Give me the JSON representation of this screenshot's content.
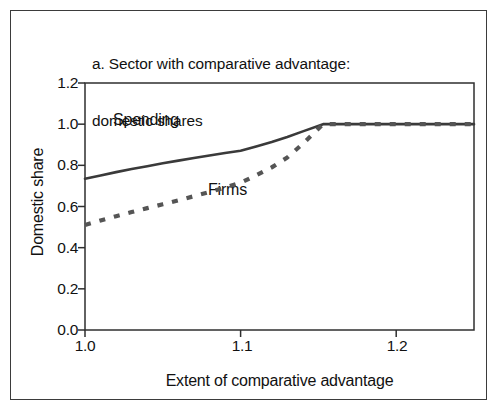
{
  "figure": {
    "title_line1": "a. Sector with comparative advantage:",
    "title_line2": "domestic shares",
    "frame_color": "#3b3b3b",
    "background_color": "#ffffff"
  },
  "chart_data": {
    "type": "line",
    "title": "a. Sector with comparative advantage: domestic shares",
    "xlabel": "Extent of comparative advantage",
    "ylabel": "Domestic share",
    "xlim": [
      1.0,
      1.25
    ],
    "ylim": [
      0.0,
      1.2
    ],
    "xticks": [
      1.0,
      1.1,
      1.2
    ],
    "xtick_labels": [
      "1.0",
      "1.1",
      "1.2"
    ],
    "yticks": [
      0.0,
      0.2,
      0.4,
      0.6,
      0.8,
      1.0,
      1.2
    ],
    "ytick_labels": [
      "0.0",
      "0.2",
      "0.4",
      "0.6",
      "0.8",
      "1.0",
      "1.2"
    ],
    "grid": false,
    "legend_position": "inline-annotations",
    "series": [
      {
        "name": "Spending",
        "style": "solid",
        "color": "#3a3a3a",
        "label_position": {
          "x": 1.018,
          "y": 1.035
        },
        "x": [
          1.0,
          1.01,
          1.02,
          1.03,
          1.04,
          1.05,
          1.06,
          1.07,
          1.08,
          1.09,
          1.1,
          1.11,
          1.12,
          1.13,
          1.14,
          1.153,
          1.17,
          1.19,
          1.21,
          1.23,
          1.25
        ],
        "y": [
          0.735,
          0.751,
          0.767,
          0.782,
          0.796,
          0.81,
          0.823,
          0.836,
          0.848,
          0.86,
          0.871,
          0.892,
          0.913,
          0.938,
          0.965,
          1.0,
          1.0,
          1.0,
          1.0,
          1.0,
          1.0
        ]
      },
      {
        "name": "Firms",
        "style": "dashed",
        "color": "#555555",
        "label_position": {
          "x": 1.079,
          "y": 0.64
        },
        "x": [
          1.0,
          1.01,
          1.02,
          1.03,
          1.04,
          1.05,
          1.06,
          1.07,
          1.08,
          1.09,
          1.1,
          1.11,
          1.12,
          1.13,
          1.14,
          1.153,
          1.17,
          1.19,
          1.21,
          1.23,
          1.25
        ],
        "y": [
          0.51,
          0.532,
          0.553,
          0.573,
          0.592,
          0.611,
          0.63,
          0.65,
          0.67,
          0.692,
          0.715,
          0.752,
          0.79,
          0.838,
          0.905,
          1.0,
          1.0,
          1.0,
          1.0,
          1.0,
          1.0
        ]
      }
    ]
  },
  "axes": {
    "x_tick_positions_px": [
      85,
      242,
      397
    ],
    "y_tick_positions_px": [
      330,
      289,
      248,
      207,
      165,
      124,
      83
    ],
    "plot_left_px": 85,
    "plot_right_px": 474,
    "plot_top_px": 83,
    "plot_bottom_px": 330
  }
}
